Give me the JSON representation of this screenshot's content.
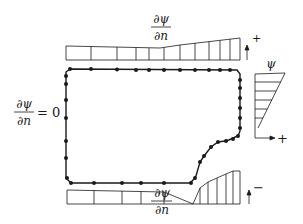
{
  "diagram": {
    "type": "boundary-condition-diagram",
    "top_label": {
      "numerator": "∂ψ",
      "denominator": "∂n"
    },
    "top_sign": "+",
    "bottom_label": {
      "numerator": "∂ψ",
      "denominator": "∂n"
    },
    "bottom_sign": "−",
    "left_label": {
      "numerator": "∂ψ",
      "denominator": "∂n",
      "equals": "= 0"
    },
    "right_label": "ψ",
    "right_sign": "+",
    "colors": {
      "stroke": "#1a1a1a",
      "background": "#ffffff"
    }
  }
}
